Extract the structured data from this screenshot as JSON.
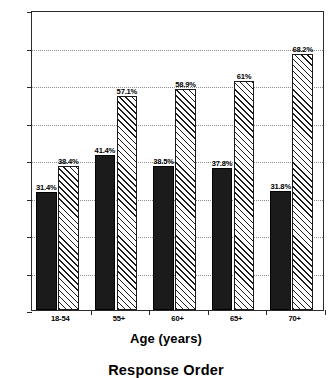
{
  "chart_data": {
    "type": "bar",
    "title": "Response Order",
    "xlabel": "Age (years)",
    "ylabel": "",
    "categories": [
      "18-54",
      "55+",
      "60+",
      "65+",
      "70+"
    ],
    "series": [
      {
        "name": "first-series-solid",
        "values": [
          31.4,
          41.4,
          38.5,
          37.8,
          31.8
        ],
        "labels": [
          "31.4%",
          "41.4%",
          "38.5%",
          "37.8%",
          "31.8%"
        ],
        "fill": "solid-black",
        "color": "#1b1b1b"
      },
      {
        "name": "second-series-hatched",
        "values": [
          38.4,
          57.1,
          58.9,
          61.0,
          68.2
        ],
        "labels": [
          "38.4%",
          "57.1%",
          "58.9%",
          "61%",
          "68.2%"
        ],
        "fill": "diagonal-hatch",
        "color": "#ffffff"
      }
    ],
    "ylim": [
      0,
      80
    ],
    "yticks": [
      0,
      10,
      20,
      30,
      40,
      50,
      60,
      70,
      80
    ],
    "ytick_labels": [
      "0%",
      "10%",
      "20%",
      "30%",
      "40%",
      "50%",
      "60%",
      "70%",
      "80%"
    ],
    "grid": true,
    "grid_style": "dotted-horizontal",
    "legend": "none",
    "axis_color": "#2b2b2b"
  }
}
